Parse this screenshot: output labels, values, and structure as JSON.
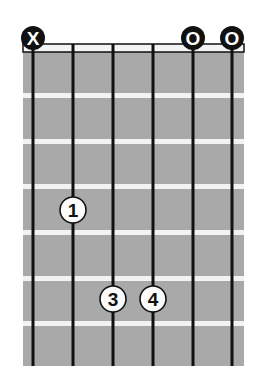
{
  "chord_diagram": {
    "colors": {
      "fretboard": "#a9a9a9",
      "fret": "#f2f2f2",
      "string": "#111111",
      "nut_fill": "#f4f4f4",
      "marker_dark": "#111111",
      "marker_light": "#ffffff",
      "finger_fill": "#fbfbfb"
    },
    "strings": 6,
    "frets": 7,
    "open_muted": [
      {
        "string": 1,
        "symbol": "X",
        "label": "X"
      },
      {
        "string": 5,
        "symbol": "O",
        "label": "O"
      },
      {
        "string": 6,
        "symbol": "O",
        "label": "O"
      }
    ],
    "fingers": [
      {
        "string": 2,
        "fret": 4,
        "finger": "1"
      },
      {
        "string": 3,
        "fret": 6,
        "finger": "3"
      },
      {
        "string": 4,
        "fret": 6,
        "finger": "4"
      }
    ]
  }
}
